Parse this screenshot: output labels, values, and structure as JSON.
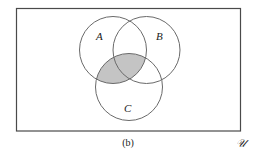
{
  "diagram": {
    "type": "venn",
    "caption": "(b)",
    "universe_label": "𝒰",
    "sets": [
      {
        "id": "A",
        "label": "A",
        "cx": 113,
        "cy": 50,
        "r": 33.5
      },
      {
        "id": "B",
        "label": "B",
        "cx": 146.5,
        "cy": 50,
        "r": 33.5
      },
      {
        "id": "C",
        "label": "C",
        "cx": 129,
        "cy": 87,
        "r": 33.5
      }
    ],
    "shaded_region": "A ∩ C",
    "colors": {
      "stroke": "#6a6a6a",
      "shade": "#c4c4c4",
      "frame": "#4a4a4a",
      "background": "#ffffff"
    }
  }
}
